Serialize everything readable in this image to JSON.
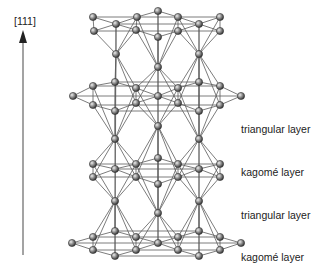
{
  "axis": {
    "label": "[111]",
    "color": "#333333"
  },
  "layers": [
    {
      "name": "triangular layer",
      "y": 129
    },
    {
      "name": "kagomé layer",
      "y": 177
    },
    {
      "name": "triangular layer",
      "y": 216
    },
    {
      "name": "kagomé layer",
      "y": 255
    }
  ],
  "colors": {
    "bond": "#555555",
    "atom_fill": "#8a8a8a",
    "atom_stroke": "#333333",
    "atom_highlight": "#e0e0e0"
  },
  "atoms": {
    "K1": [
      [
        93,
        17
      ],
      [
        116,
        24
      ],
      [
        137,
        17
      ],
      [
        158,
        11
      ],
      [
        178,
        17
      ],
      [
        199,
        24
      ],
      [
        220,
        17
      ],
      [
        94,
        31
      ],
      [
        136,
        30
      ],
      [
        158,
        37
      ],
      [
        178,
        31
      ],
      [
        220,
        31
      ]
    ],
    "T1": [
      [
        116,
        54
      ],
      [
        199,
        54
      ],
      [
        158,
        67
      ]
    ],
    "K2": [
      [
        73,
        96
      ],
      [
        93,
        86
      ],
      [
        115,
        82
      ],
      [
        136,
        88
      ],
      [
        158,
        96
      ],
      [
        178,
        88
      ],
      [
        199,
        82
      ],
      [
        220,
        86
      ],
      [
        241,
        96
      ],
      [
        93,
        105
      ],
      [
        115,
        111
      ],
      [
        136,
        103
      ],
      [
        178,
        103
      ],
      [
        199,
        111
      ],
      [
        220,
        105
      ]
    ],
    "T2": [
      [
        115,
        139
      ],
      [
        199,
        139
      ],
      [
        158,
        126
      ]
    ],
    "K3": [
      [
        93,
        164
      ],
      [
        115,
        169
      ],
      [
        136,
        164
      ],
      [
        158,
        158
      ],
      [
        178,
        164
      ],
      [
        199,
        169
      ],
      [
        220,
        164
      ],
      [
        93,
        177
      ],
      [
        136,
        177
      ],
      [
        158,
        184
      ],
      [
        178,
        177
      ],
      [
        220,
        177
      ]
    ],
    "T3": [
      [
        115,
        201
      ],
      [
        199,
        201
      ],
      [
        158,
        213
      ]
    ],
    "K4": [
      [
        72,
        243
      ],
      [
        93,
        237
      ],
      [
        115,
        231
      ],
      [
        136,
        237
      ],
      [
        158,
        243
      ],
      [
        178,
        237
      ],
      [
        199,
        231
      ],
      [
        220,
        237
      ],
      [
        241,
        243
      ],
      [
        93,
        250
      ],
      [
        115,
        256
      ],
      [
        136,
        250
      ],
      [
        178,
        250
      ],
      [
        199,
        256
      ],
      [
        220,
        250
      ]
    ]
  }
}
